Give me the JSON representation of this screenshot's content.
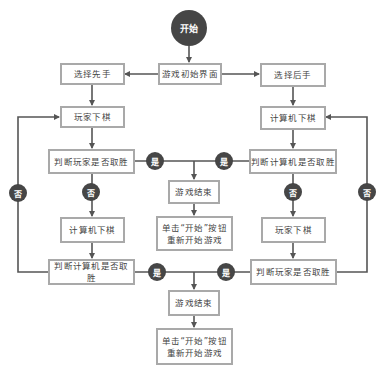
{
  "colors": {
    "node_fill": "#464646",
    "box_border": "#a9a9a9",
    "line": "#555555",
    "text": "#444444"
  },
  "start": {
    "label": "开始"
  },
  "init": {
    "label": "游戏初始界面"
  },
  "left": {
    "choose": "选择先手",
    "player_move": "玩家下棋",
    "check_player": "判断玩家是否取胜",
    "computer_move": "计算机下棋",
    "check_computer": "判断计算机是否取胜"
  },
  "right": {
    "choose": "选择后手",
    "computer_move": "计算机下棋",
    "check_computer": "判断计算机是否取胜",
    "player_move": "玩家下棋",
    "check_player": "判断玩家是否取胜"
  },
  "mid1": {
    "end": "游戏结束",
    "restart_line1": "单击“开始”按钮",
    "restart_line2": "重新开始游戏"
  },
  "mid2": {
    "end": "游戏结束",
    "restart_line1": "单击“开始”按钮",
    "restart_line2": "重新开始游戏"
  },
  "labels": {
    "yes": "是",
    "no": "否"
  }
}
